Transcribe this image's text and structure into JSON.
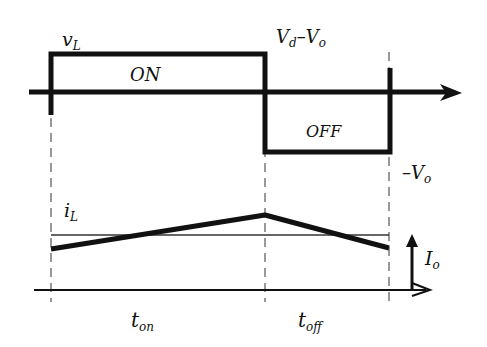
{
  "diagram": {
    "voltage_waveform": {
      "label_main": "v",
      "label_sub": "L",
      "on_label": "ON",
      "off_label": "OFF",
      "positive_level_main": "V",
      "positive_level_sub1": "d",
      "positive_level_sep": "–V",
      "positive_level_sub2": "o",
      "negative_level_main": "–V",
      "negative_level_sub": "o"
    },
    "current_waveform": {
      "label_main": "i",
      "label_sub": "L",
      "average_main": "I",
      "average_sub": "o"
    },
    "time_axis": {
      "on_main": "t",
      "on_sub": "on",
      "off_main": "t",
      "off_sub": "off"
    },
    "colors": {
      "stroke": "#111111",
      "background": "#ffffff"
    }
  }
}
